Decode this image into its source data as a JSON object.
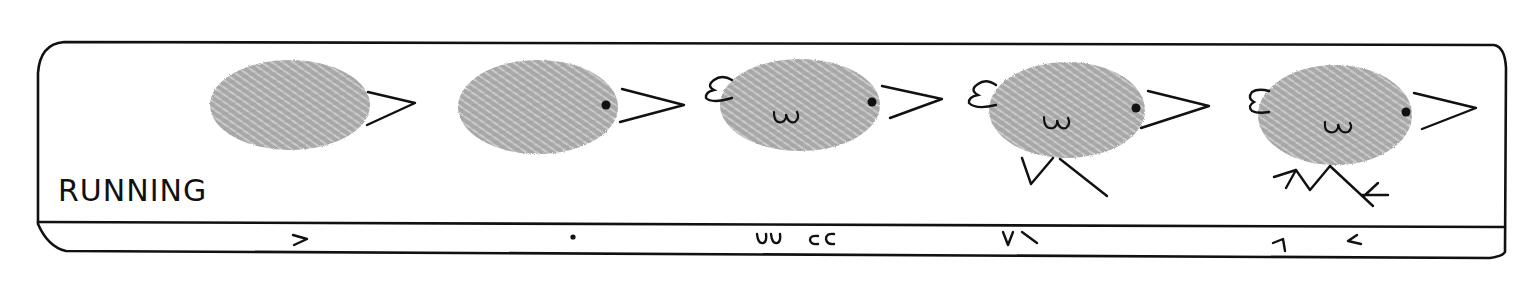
{
  "diagram": {
    "title": "RUNNING",
    "colors": {
      "ink": "#111111",
      "fingerprint": "#a8a8a8",
      "fingerprint_ridge": "#d9d9d9",
      "background": "#ffffff"
    },
    "steps": [
      {
        "index": 1,
        "description": "Fingerprint body with beak",
        "legend_glyph": ">",
        "parts": [
          "body",
          "beak"
        ]
      },
      {
        "index": 2,
        "description": "Add eye",
        "legend_glyph": "•",
        "parts": [
          "body",
          "beak",
          "eye"
        ]
      },
      {
        "index": 3,
        "description": "Add wing and tail",
        "legend_glyph": "ᴗᴗ cc",
        "parts": [
          "body",
          "beak",
          "eye",
          "wing",
          "tail"
        ]
      },
      {
        "index": 4,
        "description": "Add running legs",
        "legend_glyph": "V ⟍",
        "parts": [
          "body",
          "beak",
          "eye",
          "wing",
          "tail",
          "legs"
        ]
      },
      {
        "index": 5,
        "description": "Add feet",
        "legend_glyph": "1 <",
        "parts": [
          "body",
          "beak",
          "eye",
          "wing",
          "tail",
          "legs",
          "feet"
        ]
      }
    ]
  }
}
